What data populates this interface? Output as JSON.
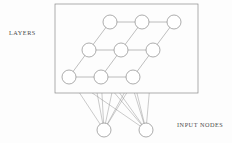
{
  "figure": {
    "background_color": "#fdfdfd",
    "stroke_color": "#8a8a8a",
    "node_fill_color": "#ffffff",
    "label_color": "#4a4a4a",
    "width": 232,
    "height": 143
  },
  "labels": {
    "layers": "LAYERS",
    "input_nodes": "INPUT NODES"
  },
  "panel": {
    "name": "layer-sheet-border",
    "x": 55,
    "y": 4,
    "width": 143,
    "height": 89
  },
  "chart_data": {
    "type": "diagram",
    "annotations": [
      "LAYERS",
      "INPUT NODES"
    ],
    "layer_grid": {
      "rows": 3,
      "columns": 3,
      "shear_x_per_row": -21,
      "radius": 7,
      "nodes": [
        {
          "id": "n00",
          "row": 0,
          "col": 0,
          "cx": 110,
          "cy": 22
        },
        {
          "id": "n01",
          "row": 0,
          "col": 1,
          "cx": 142,
          "cy": 22
        },
        {
          "id": "n02",
          "row": 0,
          "col": 2,
          "cx": 174,
          "cy": 22
        },
        {
          "id": "n10",
          "row": 1,
          "col": 0,
          "cx": 89,
          "cy": 50
        },
        {
          "id": "n11",
          "row": 1,
          "col": 1,
          "cx": 121,
          "cy": 50
        },
        {
          "id": "n12",
          "row": 1,
          "col": 2,
          "cx": 153,
          "cy": 50
        },
        {
          "id": "n20",
          "row": 2,
          "col": 0,
          "cx": 69,
          "cy": 77
        },
        {
          "id": "n21",
          "row": 2,
          "col": 1,
          "cx": 101,
          "cy": 77
        },
        {
          "id": "n22",
          "row": 2,
          "col": 2,
          "cx": 133,
          "cy": 77
        }
      ],
      "row_edges": [
        [
          "n00",
          "n01"
        ],
        [
          "n01",
          "n02"
        ],
        [
          "n10",
          "n11"
        ],
        [
          "n11",
          "n12"
        ],
        [
          "n20",
          "n21"
        ],
        [
          "n21",
          "n22"
        ]
      ],
      "diagonal_edges": [
        [
          "n10",
          "n00"
        ],
        [
          "n11",
          "n01"
        ],
        [
          "n12",
          "n02"
        ],
        [
          "n20",
          "n10"
        ],
        [
          "n21",
          "n11"
        ],
        [
          "n22",
          "n12"
        ]
      ]
    },
    "input_layer": {
      "radius": 7,
      "nodes": [
        {
          "id": "i0",
          "cx": 104,
          "cy": 130
        },
        {
          "id": "i1",
          "cx": 146,
          "cy": 130
        }
      ]
    },
    "input_connections": [
      [
        "i0",
        "n20"
      ],
      [
        "i0",
        "n21"
      ],
      [
        "i0",
        "n22"
      ],
      [
        "i0",
        "n10"
      ],
      [
        "i0",
        "n11"
      ],
      [
        "i0",
        "n12"
      ],
      [
        "i1",
        "n20"
      ],
      [
        "i1",
        "n21"
      ],
      [
        "i1",
        "n22"
      ],
      [
        "i1",
        "n10"
      ],
      [
        "i1",
        "n11"
      ],
      [
        "i1",
        "n12"
      ]
    ]
  }
}
